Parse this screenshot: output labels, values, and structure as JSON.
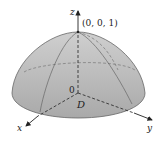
{
  "figure": {
    "axes": {
      "x_label": "x",
      "y_label": "y",
      "z_label": "z"
    },
    "origin_label": "0",
    "apex_label": "(0, 0, 1)",
    "region_label": "D",
    "colors": {
      "surface_fill": "#b4b4b4",
      "surface_top": "#c8c8c8",
      "edge": "#555555",
      "axis": "#222222"
    }
  }
}
